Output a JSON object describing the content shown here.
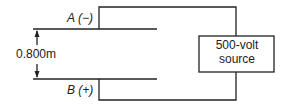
{
  "diagram": {
    "plate_a_label": "A (−)",
    "plate_b_label": "B (+)",
    "separation_label": "0.800m",
    "source_line1": "500-volt",
    "source_line2": "source",
    "line_color": "#222222"
  }
}
